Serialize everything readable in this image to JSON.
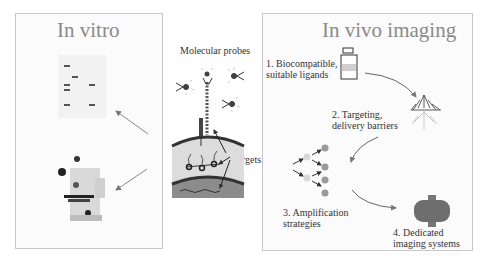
{
  "in_vitro": {
    "title": "In vitro",
    "items": [
      "gel-blot",
      "microscope"
    ]
  },
  "center": {
    "probes_label": "Molecular probes",
    "targets_label": "Targets"
  },
  "in_vivo": {
    "title": "In vivo imaging",
    "steps": [
      {
        "line1": "1. Biocompatible,",
        "line2": "suitable ligands"
      },
      {
        "line1": "2. Targeting,",
        "line2": "delivery barriers"
      },
      {
        "line1": "3. Amplification",
        "line2": "strategies"
      },
      {
        "line1": "4. Dedicated",
        "line2": "imaging systems"
      }
    ]
  },
  "colors": {
    "border": "#c8c8c8",
    "title": "#8a8a8a",
    "arrow": "#888888",
    "dot_light": "#d8d8d8",
    "dot_dark": "#9a9a9a",
    "scanner": "#6e6e6e"
  }
}
